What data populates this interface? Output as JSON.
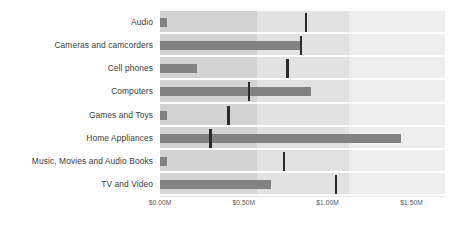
{
  "chart_data": {
    "type": "bar",
    "chart_subtype": "bullet",
    "title": "",
    "subtitle": "",
    "xlabel": "",
    "ylabel": "",
    "orientation": "horizontal",
    "categories": [
      "Audio",
      "Cameras and camcorders",
      "Cell phones",
      "Computers",
      "Games and Toys",
      "Home Appliances",
      "Music, Movies and Audio Books",
      "TV and Video"
    ],
    "series": [
      {
        "name": "Actual",
        "values": [
          0.04,
          0.84,
          0.22,
          0.9,
          0.04,
          1.44,
          0.04,
          0.66
        ]
      },
      {
        "name": "Target",
        "values": [
          0.87,
          0.84,
          0.76,
          0.53,
          0.41,
          0.3,
          0.74,
          1.05
        ]
      }
    ],
    "xlim": [
      0.0,
      1.7
    ],
    "xticks": [
      0.0,
      0.5,
      1.0,
      1.5
    ],
    "xtick_labels": [
      "$0.00M",
      "$0.50M",
      "$1.00M",
      "$1.50M"
    ],
    "value_format": "$0.00M",
    "grid": false,
    "legend": "none",
    "range_bands": [
      {
        "name": "poor",
        "from": 0.0,
        "to": 0.58,
        "color": "#d3d3d3"
      },
      {
        "name": "satisfactory",
        "from": 0.58,
        "to": 1.13,
        "color": "#e2e2e2"
      },
      {
        "name": "good",
        "from": 1.13,
        "to": 1.7,
        "color": "#eeeeee"
      }
    ],
    "colors": {
      "measure_bar": "#828282",
      "target_marker": "#2b2b2b",
      "background": "#ffffff",
      "label_text": "#3a3a3a",
      "tick_text": "#555555"
    }
  }
}
